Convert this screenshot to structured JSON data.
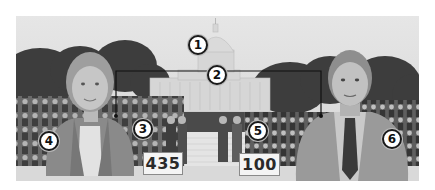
{
  "figure": {
    "colors": {
      "background": "#ffffff",
      "sky": "#e4e4e4",
      "trees": "#3c3c3c",
      "capitol": "#d8d8d8",
      "crowd": "#5a5a5a",
      "callout_border": "#1a1a1a"
    },
    "callouts": [
      {
        "number": "1",
        "target": "capitol-dome",
        "x": 198,
        "y": 45
      },
      {
        "number": "2",
        "target": "bracket-both-chambers",
        "x": 217,
        "y": 75
      },
      {
        "number": "3",
        "target": "house-group",
        "x": 143,
        "y": 129
      },
      {
        "number": "4",
        "target": "woman-representative",
        "x": 49,
        "y": 141
      },
      {
        "number": "5",
        "target": "senate-group",
        "x": 258,
        "y": 131
      },
      {
        "number": "6",
        "target": "man-senator",
        "x": 392,
        "y": 139
      }
    ],
    "cards": [
      {
        "label": "435",
        "group": "house"
      },
      {
        "label": "100",
        "group": "senate"
      }
    ]
  }
}
